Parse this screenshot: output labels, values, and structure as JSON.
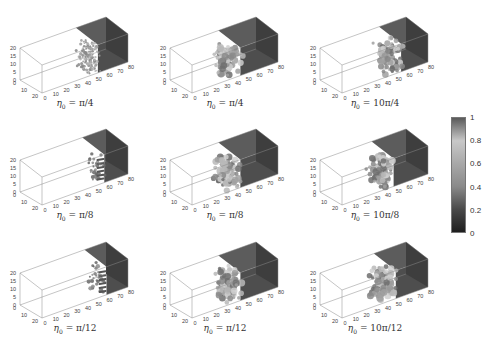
{
  "chart_data": {
    "type": "heatmap",
    "subtype": "3d-volume-grid",
    "title": "",
    "layout": {
      "rows": 3,
      "cols": 3
    },
    "axes": {
      "x_ticks": [
        "0",
        "10",
        "20",
        "30",
        "40",
        "50",
        "60",
        "70",
        "80"
      ],
      "y_ticks": [
        "0",
        "10",
        "20"
      ],
      "z_ticks": [
        "0",
        "5",
        "10",
        "15",
        "20"
      ],
      "x_range": [
        0,
        80
      ],
      "y_range": [
        0,
        20
      ],
      "z_range": [
        0,
        20
      ]
    },
    "panels": [
      {
        "row": 0,
        "col": 0,
        "caption_var": "η",
        "caption_sub": "0",
        "caption_value": "= π/4",
        "front_x": 52,
        "texture": "fine"
      },
      {
        "row": 0,
        "col": 1,
        "caption_var": "η",
        "caption_sub": "0",
        "caption_value": "= π/4",
        "front_x": 45,
        "texture": "medium"
      },
      {
        "row": 0,
        "col": 2,
        "caption_var": "η",
        "caption_sub": "0",
        "caption_value": "= 10π/4",
        "front_x": 55,
        "texture": "blobby"
      },
      {
        "row": 1,
        "col": 0,
        "caption_var": "η",
        "caption_sub": "0",
        "caption_value": "= π/8",
        "front_x": 58,
        "texture": "fingers"
      },
      {
        "row": 1,
        "col": 1,
        "caption_var": "η",
        "caption_sub": "0",
        "caption_value": "= π/8",
        "front_x": 45,
        "texture": "medium"
      },
      {
        "row": 1,
        "col": 2,
        "caption_var": "η",
        "caption_sub": "0",
        "caption_value": "= 10π/8",
        "front_x": 48,
        "texture": "blobby"
      },
      {
        "row": 2,
        "col": 0,
        "caption_var": "η",
        "caption_sub": "0",
        "caption_value": "= π/12",
        "front_x": 60,
        "texture": "fingers"
      },
      {
        "row": 2,
        "col": 1,
        "caption_var": "η",
        "caption_sub": "0",
        "caption_value": "= π/12",
        "front_x": 45,
        "texture": "blobby"
      },
      {
        "row": 2,
        "col": 2,
        "caption_var": "η",
        "caption_sub": "0",
        "caption_value": "= 10π/12",
        "front_x": 50,
        "texture": "blobby"
      }
    ],
    "colorbar": {
      "range": [
        0,
        1
      ],
      "ticks": [
        "1",
        "0.8",
        "0.6",
        "0.4",
        "0.2",
        "0"
      ],
      "colormap": "gray-custom",
      "stops": [
        {
          "v": 1.0,
          "color": "#5a5a5a"
        },
        {
          "v": 0.8,
          "color": "#c8c8c8"
        },
        {
          "v": 0.6,
          "color": "#a8a8a8"
        },
        {
          "v": 0.4,
          "color": "#8a8a8a"
        },
        {
          "v": 0.2,
          "color": "#4a4a4a"
        },
        {
          "v": 0.0,
          "color": "#1e1e1e"
        }
      ]
    }
  }
}
